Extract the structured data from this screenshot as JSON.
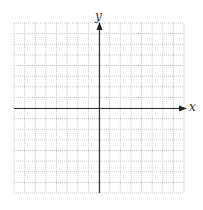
{
  "diagram": {
    "type": "coordinate-plane",
    "x_axis_label": "x",
    "y_axis_label": "y",
    "grid": {
      "columns": 16,
      "rows": 16,
      "minor_style": "dotted",
      "line_color": "#b8b8b8"
    },
    "axis_color": "#333333",
    "tick_labels": []
  }
}
